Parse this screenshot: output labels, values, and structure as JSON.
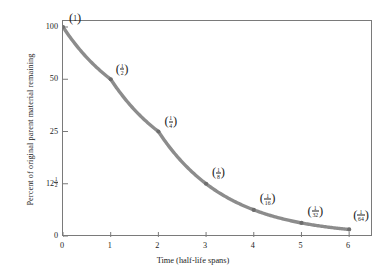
{
  "chart_data": {
    "type": "line",
    "title": "",
    "xlabel": "Time (half-life spans)",
    "ylabel": "Percent of original parent material remaining",
    "grid": false,
    "legend": false,
    "xlim": [
      0,
      6.5
    ],
    "ylim": [
      0,
      100
    ],
    "x": [
      0,
      1,
      2,
      3,
      4,
      5,
      6
    ],
    "values": [
      100,
      50,
      25,
      12.5,
      6.25,
      3.125,
      1.5625
    ],
    "xticks": [
      "0",
      "1",
      "2",
      "3",
      "4",
      "5",
      "6"
    ],
    "xtick_values": [
      0,
      1,
      2,
      3,
      4,
      5,
      6
    ],
    "yticks": [
      "100",
      "50",
      "25",
      "12½",
      "0"
    ],
    "ytick_values": [
      100,
      50,
      25,
      12.5,
      0
    ],
    "point_labels": [
      "(1)",
      "(1/2)",
      "(1/4)",
      "(1/8)",
      "(1/16)",
      "(1/32)",
      "(1/64)"
    ],
    "point_fractions": [
      {
        "whole": "1",
        "num": "",
        "den": ""
      },
      {
        "whole": "",
        "num": "1",
        "den": "2"
      },
      {
        "whole": "",
        "num": "1",
        "den": "4"
      },
      {
        "whole": "",
        "num": "1",
        "den": "8"
      },
      {
        "whole": "",
        "num": "1",
        "den": "16"
      },
      {
        "whole": "",
        "num": "1",
        "den": "32"
      },
      {
        "whole": "",
        "num": "1",
        "den": "64"
      }
    ],
    "curve_color": "#8c8c8c",
    "point_color": "#6e6e6e",
    "frame_color": "#7a7a7a",
    "text_color": "#1c1c1c",
    "background_color": "#ffffff"
  },
  "ytick_12half": {
    "whole": "12",
    "num": "1",
    "den": "2"
  }
}
